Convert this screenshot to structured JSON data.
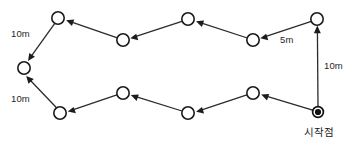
{
  "diagram": {
    "background_color": "#ffffff",
    "stroke_color": "#2b2b2b",
    "node_fill": "#ffffff",
    "start_node_color": "#111111",
    "nodes": [
      {
        "id": "start",
        "name": "start-point-node",
        "x": 318,
        "y": 112,
        "type": "filled",
        "r": 5.2
      },
      {
        "id": "n1",
        "name": "waypoint-node-1",
        "x": 317,
        "y": 19,
        "type": "open",
        "r": 6.2
      },
      {
        "id": "n2",
        "name": "waypoint-node-2",
        "x": 253,
        "y": 40,
        "type": "open",
        "r": 6.2
      },
      {
        "id": "n3",
        "name": "waypoint-node-3",
        "x": 188,
        "y": 19,
        "type": "open",
        "r": 6.2
      },
      {
        "id": "n4",
        "name": "waypoint-node-4",
        "x": 123,
        "y": 40,
        "type": "open",
        "r": 6.2
      },
      {
        "id": "n5",
        "name": "waypoint-node-5",
        "x": 58,
        "y": 18,
        "type": "open",
        "r": 6.2
      },
      {
        "id": "n6",
        "name": "waypoint-node-6",
        "x": 24,
        "y": 68,
        "type": "open",
        "r": 6.2
      },
      {
        "id": "n7",
        "name": "waypoint-node-7",
        "x": 60,
        "y": 113,
        "type": "open",
        "r": 6.2
      },
      {
        "id": "n8",
        "name": "waypoint-node-8",
        "x": 123,
        "y": 93,
        "type": "open",
        "r": 6.2
      },
      {
        "id": "n9",
        "name": "waypoint-node-9",
        "x": 188,
        "y": 113,
        "type": "open",
        "r": 6.2
      },
      {
        "id": "n10",
        "name": "waypoint-node-10",
        "x": 253,
        "y": 93,
        "type": "open",
        "r": 6.2
      }
    ],
    "edges": [
      {
        "name": "edge-start-to-n1",
        "from": "start",
        "to": "n1"
      },
      {
        "name": "edge-n1-to-n2",
        "from": "n1",
        "to": "n2"
      },
      {
        "name": "edge-n2-to-n3",
        "from": "n2",
        "to": "n3"
      },
      {
        "name": "edge-n3-to-n4",
        "from": "n3",
        "to": "n4"
      },
      {
        "name": "edge-n4-to-n5",
        "from": "n4",
        "to": "n5"
      },
      {
        "name": "edge-n5-to-n6",
        "from": "n5",
        "to": "n6"
      },
      {
        "name": "edge-n7-to-n6",
        "from": "n7",
        "to": "n6"
      },
      {
        "name": "edge-n8-to-n7",
        "from": "n8",
        "to": "n7"
      },
      {
        "name": "edge-n9-to-n8",
        "from": "n9",
        "to": "n8"
      },
      {
        "name": "edge-n10-to-n9",
        "from": "n10",
        "to": "n9"
      },
      {
        "name": "edge-start-to-n10",
        "from": "start",
        "to": "n10"
      }
    ],
    "labels": {
      "distance_top_left": "10m",
      "distance_bottom_left": "10m",
      "distance_top_right": "5m",
      "distance_right_vertical": "10m",
      "start_point": "시작점"
    }
  }
}
